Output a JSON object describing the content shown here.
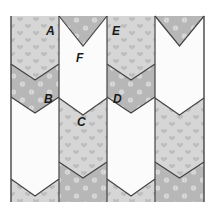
{
  "figure": {
    "bounds": {
      "x0": 11,
      "y0": 16,
      "x1": 204,
      "y1": 202
    },
    "colors": {
      "heart_fabric": "#d6d6d6",
      "heart_motif": "#bdbdbd",
      "snow_fabric": "#b7b7b7",
      "snow_motif": "#dcdcdc",
      "white_fabric": "#fbfbfb",
      "seam": "#444444"
    },
    "columns": [
      {
        "x0": 11,
        "x1": 59,
        "patches": [
          {
            "fabric": "heart",
            "edge_top": 16,
            "tip_top": 16
          },
          {
            "fabric": "snow",
            "edge_top": 64,
            "tip_top": 80
          },
          {
            "fabric": "white",
            "edge_top": 97,
            "tip_top": 113
          },
          {
            "fabric": "heart",
            "edge_top": 179,
            "tip_top": 196
          }
        ]
      },
      {
        "x0": 59,
        "x1": 107,
        "patches": [
          {
            "fabric": "snow",
            "edge_top": 16,
            "tip_top": 16
          },
          {
            "fabric": "white",
            "edge_top": 16,
            "tip_top": 46
          },
          {
            "fabric": "heart",
            "edge_top": 98,
            "tip_top": 115
          },
          {
            "fabric": "snow",
            "edge_top": 162,
            "tip_top": 178
          }
        ]
      },
      {
        "x0": 107,
        "x1": 155,
        "patches": [
          {
            "fabric": "heart",
            "edge_top": 16,
            "tip_top": 16
          },
          {
            "fabric": "snow",
            "edge_top": 64,
            "tip_top": 80
          },
          {
            "fabric": "white",
            "edge_top": 97,
            "tip_top": 113
          },
          {
            "fabric": "heart",
            "edge_top": 179,
            "tip_top": 196
          }
        ]
      },
      {
        "x0": 155,
        "x1": 204,
        "patches": [
          {
            "fabric": "snow",
            "edge_top": 16,
            "tip_top": 16
          },
          {
            "fabric": "white",
            "edge_top": 16,
            "tip_top": 46
          },
          {
            "fabric": "heart",
            "edge_top": 98,
            "tip_top": 115
          },
          {
            "fabric": "snow",
            "edge_top": 162,
            "tip_top": 178
          }
        ]
      }
    ],
    "labels": [
      {
        "text": "A",
        "x": 46,
        "y": 25
      },
      {
        "text": "F",
        "x": 76,
        "y": 52
      },
      {
        "text": "E",
        "x": 112,
        "y": 25
      },
      {
        "text": "B",
        "x": 44,
        "y": 93
      },
      {
        "text": "D",
        "x": 113,
        "y": 93
      },
      {
        "text": "C",
        "x": 77,
        "y": 116
      }
    ]
  }
}
